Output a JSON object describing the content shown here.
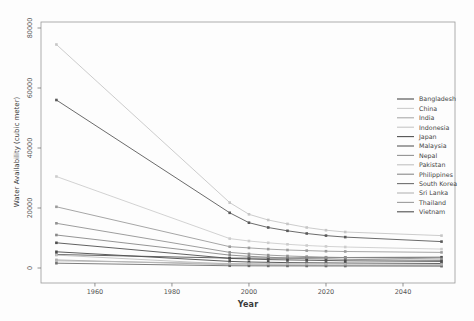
{
  "chart_data": {
    "type": "line",
    "title": "",
    "xlabel": "Year",
    "ylabel": "Water Availability (cubic meter)",
    "x_ticks": [
      1960,
      1980,
      2000,
      2020,
      2040
    ],
    "y_ticks": [
      0,
      20000,
      40000,
      60000,
      80000
    ],
    "xlim": [
      1946,
      2053.5
    ],
    "ylim": [
      -5000,
      82000
    ],
    "grid": false,
    "legend_position": "center-right-inside",
    "marker": "square",
    "years": [
      1950,
      1995,
      2000,
      2005,
      2010,
      2015,
      2020,
      2025,
      2050
    ],
    "series": [
      {
        "name": "Bangladesh",
        "color": "#4a4a4a",
        "values": [
          5400,
          2200,
          2000,
          1900,
          1800,
          1750,
          1700,
          1650,
          1500
        ]
      },
      {
        "name": "China",
        "color": "#cdcdcd",
        "values": [
          30500,
          9800,
          9000,
          8400,
          7900,
          7500,
          7200,
          7000,
          6300
        ]
      },
      {
        "name": "India",
        "color": "#a9a9a9",
        "values": [
          2700,
          1100,
          1050,
          1000,
          960,
          930,
          900,
          880,
          800
        ]
      },
      {
        "name": "Indonesia",
        "color": "#c6c6c6",
        "values": [
          74500,
          21800,
          17900,
          16000,
          14700,
          13500,
          12600,
          12000,
          10800
        ]
      },
      {
        "name": "Japan",
        "color": "#525252",
        "values": [
          4500,
          3300,
          3300,
          3300,
          3300,
          3400,
          3400,
          3500,
          3600
        ]
      },
      {
        "name": "Malaysia",
        "color": "#5a5a5a",
        "values": [
          56000,
          18400,
          15100,
          13500,
          12400,
          11500,
          10800,
          10300,
          8800
        ]
      },
      {
        "name": "Nepal",
        "color": "#929292",
        "values": [
          14900,
          5200,
          4700,
          4300,
          4000,
          3800,
          3600,
          3500,
          3000
        ]
      },
      {
        "name": "Pakistan",
        "color": "#c0c0c0",
        "values": [
          4300,
          1300,
          1200,
          1100,
          1000,
          950,
          900,
          870,
          700
        ]
      },
      {
        "name": "Philippines",
        "color": "#888888",
        "values": [
          11000,
          4300,
          3900,
          3600,
          3300,
          3100,
          3000,
          2900,
          2500
        ]
      },
      {
        "name": "South Korea",
        "color": "#6f6f6f",
        "values": [
          1600,
          750,
          720,
          700,
          690,
          680,
          670,
          660,
          620
        ]
      },
      {
        "name": "Sri Lanka",
        "color": "#b5b5b5",
        "values": [
          2400,
          1500,
          1450,
          1400,
          1380,
          1350,
          1330,
          1300,
          1200
        ]
      },
      {
        "name": "Thailand",
        "color": "#9c9c9c",
        "values": [
          20400,
          7100,
          6700,
          6300,
          6000,
          5800,
          5600,
          5500,
          5200
        ]
      },
      {
        "name": "Vietnam",
        "color": "#4f4f4f",
        "values": [
          8400,
          3200,
          3000,
          2800,
          2700,
          2600,
          2500,
          2400,
          2200
        ]
      }
    ],
    "style": {
      "spine_color": "#999999",
      "tick_color": "#777777",
      "tick_label_color": "#555555",
      "legend_text_color": "#444444",
      "background": "#fdfdfd"
    }
  }
}
